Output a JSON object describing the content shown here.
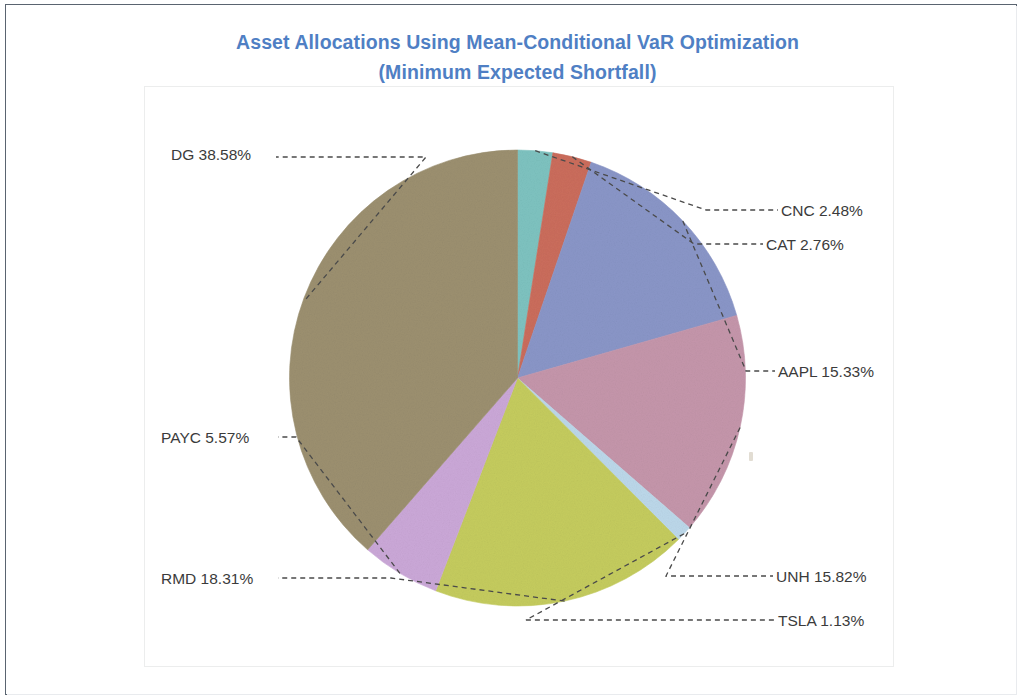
{
  "chart_title": {
    "line1": "Asset Allocations Using Mean-Conditional VaR Optimization",
    "line2": "(Minimum Expected Shortfall)",
    "color": "#4f7fc4"
  },
  "labels": {
    "dg": "DG 38.58%",
    "cnc": "CNC 2.48%",
    "cat": "CAT 2.76%",
    "aapl": "AAPL 15.33%",
    "unh": "UNH 15.82%",
    "tsla": "TSLA 1.13%",
    "payc": "PAYC 5.57%",
    "rmd": "RMD 18.31%"
  },
  "chart_data": {
    "type": "pie",
    "title": "Asset Allocations Using Mean-Conditional VaR Optimization (Minimum Expected Shortfall)",
    "subtitle": "(Minimum Expected Shortfall)",
    "xlabel": "",
    "ylabel": "",
    "grid": false,
    "legend": "none",
    "label_format": "{ticker} {percent}%",
    "start_angle_deg": 0,
    "direction": "clockwise",
    "units": "percent",
    "total": 100.0,
    "categories": [
      "CNC",
      "CAT",
      "AAPL",
      "UNH",
      "TSLA",
      "RMD",
      "PAYC",
      "DG"
    ],
    "values": [
      2.48,
      2.76,
      15.33,
      15.82,
      1.13,
      18.31,
      5.57,
      38.58
    ],
    "slices": [
      {
        "label": "CNC 2.48%",
        "ticker": "CNC",
        "value": 2.48,
        "color": "#7ec3c0"
      },
      {
        "label": "CAT 2.76%",
        "ticker": "CAT",
        "value": 2.76,
        "color": "#cb6d5c"
      },
      {
        "label": "AAPL 15.33%",
        "ticker": "AAPL",
        "value": 15.33,
        "color": "#8a96c8"
      },
      {
        "label": "UNH 15.82%",
        "ticker": "UNH",
        "value": 15.82,
        "color": "#c596ab"
      },
      {
        "label": "TSLA 1.13%",
        "ticker": "TSLA",
        "value": 1.13,
        "color": "#bcd8ea"
      },
      {
        "label": "RMD 18.31%",
        "ticker": "RMD",
        "value": 18.31,
        "color": "#c5cc5e"
      },
      {
        "label": "PAYC 5.57%",
        "ticker": "PAYC",
        "value": 5.57,
        "color": "#cba8d8"
      },
      {
        "label": "DG 38.58%",
        "ticker": "DG",
        "value": 38.58,
        "color": "#9c9070"
      }
    ]
  }
}
